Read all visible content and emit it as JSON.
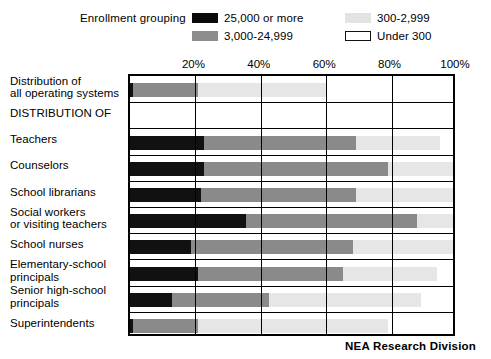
{
  "legend": {
    "title": "Enrollment grouping",
    "entries": [
      {
        "label": "25,000 or more",
        "swatch": "black-swatch-icon",
        "color": "#0a0a0a"
      },
      {
        "label": "3,000-24,999",
        "swatch": "gray-swatch-icon",
        "color": "#8c8c8c"
      },
      {
        "label": "300-2,999",
        "swatch": "light-swatch-icon",
        "color": "#e3e3e3"
      },
      {
        "label": "Under 300",
        "swatch": "white-swatch-icon",
        "color": "#ffffff"
      }
    ]
  },
  "footer": {
    "credit": "NEA Research Division"
  },
  "chart_data": {
    "type": "bar",
    "orientation": "horizontal",
    "stacked": true,
    "normalized": true,
    "title": "",
    "subtitle": "",
    "xlabel": "",
    "ylabel": "",
    "xlim": [
      0,
      100
    ],
    "xticks": [
      0,
      20,
      40,
      60,
      80,
      100
    ],
    "xtick_labels": [
      "",
      "20%",
      "40%",
      "60%",
      "80%",
      "100%"
    ],
    "grid": true,
    "legend_position": "top",
    "series": [
      {
        "name": "25,000 or more",
        "color": "#111111",
        "values": [
          1,
          null,
          23,
          23,
          22,
          36,
          19,
          21,
          13,
          1
        ]
      },
      {
        "name": "3,000-24,999",
        "color": "#8a8a8a",
        "values": [
          20,
          null,
          47,
          57,
          48,
          53,
          50,
          45,
          30,
          20
        ]
      },
      {
        "name": "300-2,999",
        "color": "#e6e6e6",
        "values": [
          40,
          null,
          26,
          20,
          30,
          11,
          31,
          29,
          47,
          59
        ]
      },
      {
        "name": "Under 300",
        "color": "#ffffff",
        "values": [
          39,
          null,
          4,
          0,
          0,
          0,
          0,
          5,
          10,
          20
        ]
      }
    ],
    "categories": [
      "Distribution of all operating systems",
      "DISTRIBUTION OF",
      "Teachers",
      "Counselors",
      "School librarians",
      "Social workers or visiting teachers",
      "School nurses",
      "Elementary-school principals",
      "Senior high-school principals",
      "Superintendents"
    ],
    "rows": [
      {
        "label_lines": [
          "Distribution of",
          "all operating systems"
        ],
        "is_header": false,
        "segments": [
          {
            "series": "25,000 or more",
            "value": 1
          },
          {
            "series": "3,000-24,999",
            "value": 20
          },
          {
            "series": "300-2,999",
            "value": 40
          },
          {
            "series": "Under 300",
            "value": 39
          }
        ]
      },
      {
        "label_lines": [
          "DISTRIBUTION OF"
        ],
        "is_header": true,
        "segments": []
      },
      {
        "label_lines": [
          "Teachers"
        ],
        "is_header": false,
        "segments": [
          {
            "series": "25,000 or more",
            "value": 23
          },
          {
            "series": "3,000-24,999",
            "value": 47
          },
          {
            "series": "300-2,999",
            "value": 26
          },
          {
            "series": "Under 300",
            "value": 4
          }
        ]
      },
      {
        "label_lines": [
          "Counselors"
        ],
        "is_header": false,
        "segments": [
          {
            "series": "25,000 or more",
            "value": 23
          },
          {
            "series": "3,000-24,999",
            "value": 57
          },
          {
            "series": "300-2,999",
            "value": 20
          },
          {
            "series": "Under 300",
            "value": 0
          }
        ]
      },
      {
        "label_lines": [
          "School librarians"
        ],
        "is_header": false,
        "segments": [
          {
            "series": "25,000 or more",
            "value": 22
          },
          {
            "series": "3,000-24,999",
            "value": 48
          },
          {
            "series": "300-2,999",
            "value": 30
          },
          {
            "series": "Under 300",
            "value": 0
          }
        ]
      },
      {
        "label_lines": [
          "Social workers",
          "or visiting teachers"
        ],
        "is_header": false,
        "segments": [
          {
            "series": "25,000 or more",
            "value": 36
          },
          {
            "series": "3,000-24,999",
            "value": 53
          },
          {
            "series": "300-2,999",
            "value": 11
          },
          {
            "series": "Under 300",
            "value": 0
          }
        ]
      },
      {
        "label_lines": [
          "School nurses"
        ],
        "is_header": false,
        "segments": [
          {
            "series": "25,000 or more",
            "value": 19
          },
          {
            "series": "3,000-24,999",
            "value": 50
          },
          {
            "series": "300-2,999",
            "value": 31
          },
          {
            "series": "Under 300",
            "value": 0
          }
        ]
      },
      {
        "label_lines": [
          "Elementary-school",
          "principals"
        ],
        "is_header": false,
        "segments": [
          {
            "series": "25,000 or more",
            "value": 21
          },
          {
            "series": "3,000-24,999",
            "value": 45
          },
          {
            "series": "300-2,999",
            "value": 29
          },
          {
            "series": "Under 300",
            "value": 5
          }
        ]
      },
      {
        "label_lines": [
          "Senior high-school",
          "principals"
        ],
        "is_header": false,
        "segments": [
          {
            "series": "25,000 or more",
            "value": 13
          },
          {
            "series": "3,000-24,999",
            "value": 30
          },
          {
            "series": "300-2,999",
            "value": 47
          },
          {
            "series": "Under 300",
            "value": 10
          }
        ]
      },
      {
        "label_lines": [
          "Superintendents"
        ],
        "is_header": false,
        "segments": [
          {
            "series": "25,000 or more",
            "value": 1
          },
          {
            "series": "3,000-24,999",
            "value": 20
          },
          {
            "series": "300-2,999",
            "value": 59
          },
          {
            "series": "Under 300",
            "value": 20
          }
        ]
      }
    ]
  }
}
